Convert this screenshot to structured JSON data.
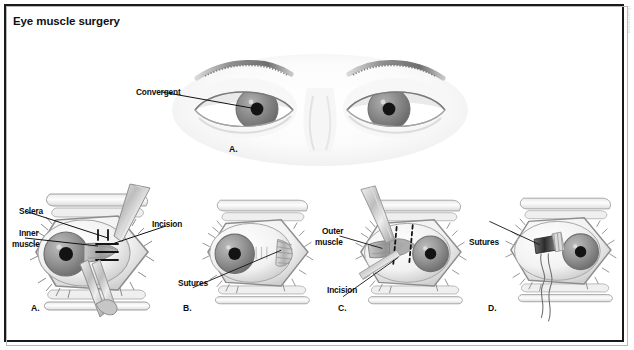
{
  "figure": {
    "title": "Eye muscle surgery",
    "watermark": "Illustration"
  },
  "top_panel": {
    "letter": "A.",
    "labels": [
      {
        "name": "convergent",
        "text": "Convergent"
      }
    ]
  },
  "panels": [
    {
      "letter": "A.",
      "labels": [
        {
          "name": "sclera",
          "text": "Sclera"
        },
        {
          "name": "inner-muscle",
          "text": "Inner\nmuscle"
        },
        {
          "name": "incision",
          "text": "Incision"
        }
      ]
    },
    {
      "letter": "B.",
      "labels": [
        {
          "name": "sutures",
          "text": "Sutures"
        }
      ]
    },
    {
      "letter": "C.",
      "labels": [
        {
          "name": "outer-muscle",
          "text": "Outer\nmuscle"
        },
        {
          "name": "incision",
          "text": "Incision"
        }
      ]
    },
    {
      "letter": "D.",
      "labels": [
        {
          "name": "sutures",
          "text": "Sutures"
        }
      ]
    }
  ],
  "label_text": {
    "convergent": "Convergent",
    "sclera": "Sclera",
    "inner_muscle_l1": "Inner",
    "inner_muscle_l2": "muscle",
    "incision_a": "Incision",
    "sutures_b": "Sutures",
    "outer_muscle_l1": "Outer",
    "outer_muscle_l2": "muscle",
    "incision_c": "Incision",
    "sutures_d": "Sutures"
  },
  "panel_letters": {
    "top": "A.",
    "a": "A.",
    "b": "B.",
    "c": "C.",
    "d": "D."
  },
  "colors": {
    "frame": "#1a1a1a",
    "ink": "#0d0d0d",
    "iris": "#8b8b8b",
    "pupil": "#111111",
    "tissue_light": "#dcdcdc",
    "tissue_mid": "#b3b3b3",
    "tissue_dark": "#8a8a8a",
    "background": "#ffffff"
  }
}
